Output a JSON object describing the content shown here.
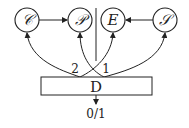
{
  "diagram": {
    "nodes": [
      {
        "id": "C",
        "label": "𝒞"
      },
      {
        "id": "P",
        "label": "𝒫"
      },
      {
        "id": "E",
        "label": "E"
      },
      {
        "id": "S",
        "label": "𝒮"
      }
    ],
    "box": {
      "label": "D"
    },
    "edge_labels": {
      "left": "2",
      "right": "1"
    },
    "output": {
      "label": "0/1"
    },
    "edges": [
      {
        "from": "C",
        "to": "P"
      },
      {
        "from": "S",
        "to": "E"
      },
      {
        "from": "D",
        "to": "C",
        "port": "2"
      },
      {
        "from": "D",
        "to": "E",
        "port": "2"
      },
      {
        "from": "D",
        "to": "P",
        "port": "1"
      },
      {
        "from": "D",
        "to": "S",
        "port": "1"
      },
      {
        "from": "D",
        "to": "output"
      }
    ]
  }
}
